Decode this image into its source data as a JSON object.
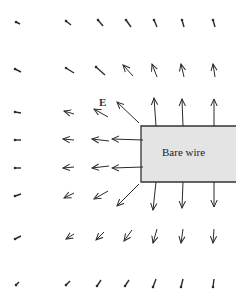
{
  "diagram": {
    "labels": {
      "field": "E",
      "wire": "Bare wire"
    },
    "colors": {
      "arrow": "#2a2a2a",
      "wire_fill": "#e4e4e4",
      "wire_stroke": "#333333",
      "background": "#ffffff"
    },
    "wire": {
      "x": 141,
      "y": 126,
      "w": 95,
      "h": 56
    },
    "arrows": [
      {
        "x1": 20,
        "y1": 24,
        "x2": 16,
        "y2": 22,
        "head": false
      },
      {
        "x1": 71,
        "y1": 25,
        "x2": 66,
        "y2": 21,
        "head": false
      },
      {
        "x1": 103,
        "y1": 26,
        "x2": 98,
        "y2": 20,
        "head": false
      },
      {
        "x1": 131,
        "y1": 27,
        "x2": 126,
        "y2": 20,
        "head": false
      },
      {
        "x1": 157,
        "y1": 27,
        "x2": 154,
        "y2": 20,
        "head": false
      },
      {
        "x1": 184,
        "y1": 27,
        "x2": 182,
        "y2": 20,
        "head": false
      },
      {
        "x1": 215,
        "y1": 27,
        "x2": 213,
        "y2": 20,
        "head": false
      },
      {
        "x1": 21,
        "y1": 72,
        "x2": 15,
        "y2": 69,
        "head": false
      },
      {
        "x1": 74,
        "y1": 73,
        "x2": 66,
        "y2": 68,
        "head": false
      },
      {
        "x1": 105,
        "y1": 75,
        "x2": 96,
        "y2": 67,
        "head": false
      },
      {
        "x1": 133,
        "y1": 76,
        "x2": 123,
        "y2": 65,
        "head": true
      },
      {
        "x1": 157,
        "y1": 77,
        "x2": 152,
        "y2": 64,
        "head": true
      },
      {
        "x1": 184,
        "y1": 77,
        "x2": 181,
        "y2": 64,
        "head": true
      },
      {
        "x1": 215,
        "y1": 77,
        "x2": 213,
        "y2": 64,
        "head": true
      },
      {
        "x1": 21,
        "y1": 113,
        "x2": 15,
        "y2": 112,
        "head": false
      },
      {
        "x1": 74,
        "y1": 114,
        "x2": 64,
        "y2": 111,
        "head": true
      },
      {
        "x1": 108,
        "y1": 117,
        "x2": 94,
        "y2": 109,
        "head": true
      },
      {
        "x1": 139,
        "y1": 123,
        "x2": 117,
        "y2": 102,
        "head": true
      },
      {
        "x1": 156,
        "y1": 126,
        "x2": 154,
        "y2": 98,
        "head": true
      },
      {
        "x1": 183,
        "y1": 126,
        "x2": 182,
        "y2": 99,
        "head": true
      },
      {
        "x1": 214,
        "y1": 126,
        "x2": 214,
        "y2": 99,
        "head": true
      },
      {
        "x1": 21,
        "y1": 140,
        "x2": 15,
        "y2": 140,
        "head": false
      },
      {
        "x1": 74,
        "y1": 140,
        "x2": 63,
        "y2": 139,
        "head": true
      },
      {
        "x1": 109,
        "y1": 141,
        "x2": 92,
        "y2": 139,
        "head": true
      },
      {
        "x1": 143,
        "y1": 140,
        "x2": 112,
        "y2": 139,
        "head": true
      },
      {
        "x1": 21,
        "y1": 168,
        "x2": 15,
        "y2": 168,
        "head": false
      },
      {
        "x1": 74,
        "y1": 167,
        "x2": 63,
        "y2": 168,
        "head": true
      },
      {
        "x1": 109,
        "y1": 166,
        "x2": 92,
        "y2": 168,
        "head": true
      },
      {
        "x1": 143,
        "y1": 167,
        "x2": 112,
        "y2": 168,
        "head": true
      },
      {
        "x1": 21,
        "y1": 194,
        "x2": 15,
        "y2": 196,
        "head": false
      },
      {
        "x1": 74,
        "y1": 193,
        "x2": 64,
        "y2": 198,
        "head": true
      },
      {
        "x1": 108,
        "y1": 191,
        "x2": 94,
        "y2": 199,
        "head": true
      },
      {
        "x1": 139,
        "y1": 184,
        "x2": 117,
        "y2": 206,
        "head": true
      },
      {
        "x1": 156,
        "y1": 182,
        "x2": 153,
        "y2": 210,
        "head": true
      },
      {
        "x1": 183,
        "y1": 182,
        "x2": 182,
        "y2": 208,
        "head": true
      },
      {
        "x1": 214,
        "y1": 182,
        "x2": 214,
        "y2": 207,
        "head": true
      },
      {
        "x1": 21,
        "y1": 236,
        "x2": 15,
        "y2": 239,
        "head": false
      },
      {
        "x1": 74,
        "y1": 234,
        "x2": 66,
        "y2": 239,
        "head": true
      },
      {
        "x1": 104,
        "y1": 232,
        "x2": 96,
        "y2": 240,
        "head": true
      },
      {
        "x1": 132,
        "y1": 230,
        "x2": 124,
        "y2": 241,
        "head": true
      },
      {
        "x1": 157,
        "y1": 229,
        "x2": 153,
        "y2": 243,
        "head": true
      },
      {
        "x1": 183,
        "y1": 229,
        "x2": 181,
        "y2": 243,
        "head": true
      },
      {
        "x1": 214,
        "y1": 229,
        "x2": 213,
        "y2": 243,
        "head": true
      },
      {
        "x1": 19,
        "y1": 282,
        "x2": 16,
        "y2": 285,
        "head": false
      },
      {
        "x1": 70,
        "y1": 281,
        "x2": 66,
        "y2": 285,
        "head": false
      },
      {
        "x1": 101,
        "y1": 280,
        "x2": 97,
        "y2": 286,
        "head": false
      },
      {
        "x1": 129,
        "y1": 280,
        "x2": 125,
        "y2": 286,
        "head": false
      },
      {
        "x1": 156,
        "y1": 279,
        "x2": 153,
        "y2": 287,
        "head": false
      },
      {
        "x1": 183,
        "y1": 279,
        "x2": 181,
        "y2": 287,
        "head": false
      },
      {
        "x1": 214,
        "y1": 279,
        "x2": 213,
        "y2": 287,
        "head": false
      }
    ]
  }
}
